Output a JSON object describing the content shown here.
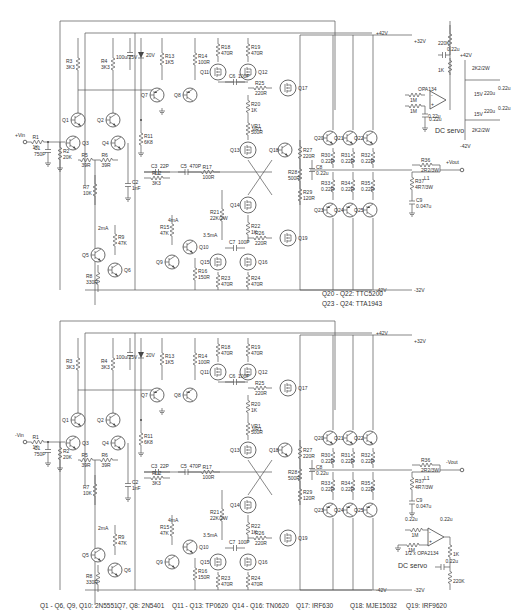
{
  "schematic": {
    "top_channel": {
      "input_label": "+Vin",
      "output_label": "+Vout",
      "rails": {
        "pos": "+42V",
        "neg": "-42V",
        "pos_out": "+32V",
        "neg_out": "-32V"
      },
      "components": [
        {
          "ref": "R1",
          "value": "1K"
        },
        {
          "ref": "C1",
          "value": "750P"
        },
        {
          "ref": "R2",
          "value": "20K"
        },
        {
          "ref": "R3",
          "value": "3K3"
        },
        {
          "ref": "R4",
          "value": "3K3"
        },
        {
          "ref": "C_zener_cap",
          "value": "100u/25V"
        },
        {
          "ref": "Z1",
          "value": "20V"
        },
        {
          "ref": "R5",
          "value": "39R"
        },
        {
          "ref": "R6",
          "value": "39R"
        },
        {
          "ref": "R7",
          "value": "10K"
        },
        {
          "ref": "R8",
          "value": "330R"
        },
        {
          "ref": "R9",
          "value": "47K"
        },
        {
          "ref": "R10",
          "value": "270R"
        },
        {
          "ref": "R11",
          "value": "6K8"
        },
        {
          "ref": "R12",
          "value": "3K3"
        },
        {
          "ref": "R13",
          "value": "1K5"
        },
        {
          "ref": "R14",
          "value": "100R"
        },
        {
          "ref": "R15",
          "value": "47K"
        },
        {
          "ref": "R16",
          "value": "150R"
        },
        {
          "ref": "R17",
          "value": "100R"
        },
        {
          "ref": "R18",
          "value": "470R"
        },
        {
          "ref": "R19",
          "value": "470R"
        },
        {
          "ref": "R20",
          "value": "1K"
        },
        {
          "ref": "VR1",
          "value": "500R"
        },
        {
          "ref": "R21",
          "value": "22K/2W"
        },
        {
          "ref": "R22",
          "value": "1K"
        },
        {
          "ref": "R23",
          "value": "470R"
        },
        {
          "ref": "R24",
          "value": "470R"
        },
        {
          "ref": "R25",
          "value": "220R"
        },
        {
          "ref": "R26",
          "value": "220R"
        },
        {
          "ref": "R27",
          "value": "220R"
        },
        {
          "ref": "R28",
          "value": "500R"
        },
        {
          "ref": "R29",
          "value": "120R"
        },
        {
          "ref": "R30",
          "value": "0.22R"
        },
        {
          "ref": "R31",
          "value": "0.22R"
        },
        {
          "ref": "R32",
          "value": "0.22R"
        },
        {
          "ref": "R33",
          "value": "0.22R"
        },
        {
          "ref": "R34",
          "value": "0.22R"
        },
        {
          "ref": "R35",
          "value": "0.22R"
        },
        {
          "ref": "R36",
          "value": "2R2/3W"
        },
        {
          "ref": "R37",
          "value": "4R7/3W"
        },
        {
          "ref": "L1",
          "value": ""
        },
        {
          "ref": "C2",
          "value": "1nF"
        },
        {
          "ref": "C3",
          "value": "22P"
        },
        {
          "ref": "C5",
          "value": "470P"
        },
        {
          "ref": "C6",
          "value": "100P"
        },
        {
          "ref": "C7",
          "value": "100P"
        },
        {
          "ref": "C8",
          "value": "0.22u"
        },
        {
          "ref": "C9",
          "value": "0.047u"
        }
      ],
      "currents": [
        "2mA",
        "4mA",
        "3.5mA"
      ],
      "dc_servo": {
        "label": "DC servo",
        "opamp": "OPA134",
        "parts": [
          "1M",
          "1M",
          "0.22u",
          "0.22u",
          "0.22u",
          "1K",
          "220K",
          "220u",
          "220u",
          "0.22u",
          "0.22u",
          "15V",
          "15V",
          "2K2/2W",
          "2K2/2W"
        ],
        "rails": {
          "pos": "+42V",
          "neg": "-42V"
        }
      }
    },
    "bottom_channel": {
      "input_label": "-Vin",
      "output_label": "-Vout",
      "rails": {
        "pos": "+42V",
        "neg": "-42V",
        "pos_out": "+32V",
        "neg_out": "-32V"
      },
      "components_same_as_top": true,
      "c9_value": "0.047u",
      "dc_servo": {
        "label": "DC servo",
        "opamp": "1/2 x OPA2134",
        "parts": [
          "0.22u",
          "0.22u",
          "1M",
          "1M",
          "1K",
          "0.22u",
          "220K"
        ]
      }
    },
    "device_notes_mid": [
      "Q20 - Q22: TTC5200",
      "Q23 - Q24: TTA1943"
    ],
    "device_notes_bottom": [
      "Q1 - Q6, Q9, Q10: 2N5551",
      "Q7, Q8: 2N5401",
      "Q11 - Q13: TP0620",
      "Q14 - Q16: TN0620",
      "Q17: IRF630",
      "Q18: MJE15032",
      "Q19: IRF9620"
    ]
  }
}
